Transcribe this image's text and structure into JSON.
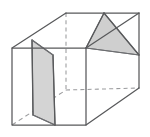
{
  "figure": {
    "kind": "geometric-solid-line-drawing",
    "projection": "oblique",
    "canvas": {
      "width": 150,
      "height": 137,
      "background": "#ffffff"
    },
    "colors": {
      "visible_edge": "#58595b",
      "visible_edge_light": "#6d6e71",
      "hidden_edge": "#9a9b9d",
      "shading_fill": "#d4d4d4",
      "shading_fill_dark": "#c9c9c9",
      "background": "#ffffff"
    },
    "vertices": {
      "front_top_left": "12,48",
      "front_top_right": "86,48",
      "front_bottom_left": "12,125",
      "front_bottom_right": "86,125",
      "back_top_left": "66,13",
      "back_top_right": "139,13",
      "back_bottom_right": "139,88",
      "back_bottom_left_hidden": "66,90"
    },
    "solid_edges": [
      {
        "name": "front-face-outline",
        "points": "12,48 86,48 86,125 12,125 12,48"
      },
      {
        "name": "top-left-slant",
        "points": "12,48 66,13"
      },
      {
        "name": "top-back-edge",
        "points": "66,13 139,13"
      },
      {
        "name": "top-right-slant",
        "points": "86,48 139,13"
      },
      {
        "name": "right-vertical-back",
        "points": "139,13 139,88"
      },
      {
        "name": "bottom-right-slant",
        "points": "86,125 139,88"
      }
    ],
    "hidden_edges": [
      {
        "name": "hidden-vertical-back-left",
        "points": "66,13 66,90"
      },
      {
        "name": "hidden-bottom-back-right",
        "points": "66,90 139,88"
      },
      {
        "name": "hidden-bottom-left-slant",
        "points": "12,125 66,90"
      }
    ],
    "shaded_regions": [
      {
        "name": "left-cross-section",
        "shape": "quadrilateral",
        "points": "32,40 53,55 55,125 33,115",
        "fill": "#d4d4d4"
      },
      {
        "name": "right-cross-section",
        "shape": "triangle",
        "points": "104,13 86,48 139,55",
        "fill": "#cfcfcf"
      }
    ],
    "section_outlines": [
      {
        "name": "left-section-left-edge",
        "points": "32,40 33,115"
      },
      {
        "name": "left-section-right-edge",
        "points": "53,55 55,125"
      },
      {
        "name": "left-section-top-edge",
        "points": "32,40 53,55"
      },
      {
        "name": "left-section-bottom-edge",
        "points": "33,115 55,125"
      },
      {
        "name": "right-section-top-edge",
        "points": "104,13 86,48"
      },
      {
        "name": "right-section-diagonal",
        "points": "104,13 139,55"
      },
      {
        "name": "right-section-base",
        "points": "86,48 139,55"
      }
    ]
  }
}
